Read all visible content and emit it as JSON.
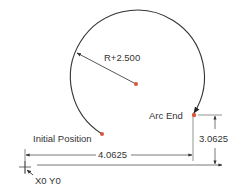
{
  "diagram": {
    "type": "cnc-arc-dimension",
    "labels": {
      "radius": "R+2.500",
      "arc_end": "Arc End",
      "initial_position": "Initial Position",
      "horizontal_dim": "4.0625",
      "vertical_dim": "3.0625",
      "origin": "X0 Y0"
    },
    "colors": {
      "line": "#333333",
      "point": "#d9573c",
      "dim_line": "#555555"
    }
  }
}
